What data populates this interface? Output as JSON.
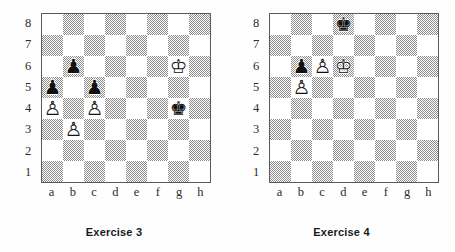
{
  "page": {
    "background_color": "#fefefe",
    "dark_square_color": "#8e8e8e",
    "light_square_color": "#ffffff",
    "border_color": "#5a5a5a"
  },
  "glyphs": {
    "white-king": "♔",
    "white-queen": "♕",
    "white-rook": "♖",
    "white-bishop": "♗",
    "white-knight": "♘",
    "white-pawn": "♙",
    "black-king": "♚",
    "black-queen": "♛",
    "black-rook": "♜",
    "black-bishop": "♝",
    "black-knight": "♞",
    "black-pawn": "♟"
  },
  "rank_labels": [
    "8",
    "7",
    "6",
    "5",
    "4",
    "3",
    "2",
    "1"
  ],
  "file_labels": [
    "a",
    "b",
    "c",
    "d",
    "e",
    "f",
    "g",
    "h"
  ],
  "diagrams": [
    {
      "caption": "Exercise 3",
      "pieces": [
        {
          "square": "b6",
          "piece": "black-pawn",
          "glyph": "♟",
          "color": "black"
        },
        {
          "square": "g6",
          "piece": "white-king",
          "glyph": "♔",
          "color": "white"
        },
        {
          "square": "a5",
          "piece": "black-pawn",
          "glyph": "♟",
          "color": "black"
        },
        {
          "square": "c5",
          "piece": "black-pawn",
          "glyph": "♟",
          "color": "black"
        },
        {
          "square": "a4",
          "piece": "white-pawn",
          "glyph": "♙",
          "color": "white"
        },
        {
          "square": "c4",
          "piece": "white-pawn",
          "glyph": "♙",
          "color": "white"
        },
        {
          "square": "g4",
          "piece": "black-king",
          "glyph": "♚",
          "color": "black"
        },
        {
          "square": "b3",
          "piece": "white-pawn",
          "glyph": "♙",
          "color": "white"
        }
      ]
    },
    {
      "caption": "Exercise 4",
      "pieces": [
        {
          "square": "d8",
          "piece": "black-king",
          "glyph": "♚",
          "color": "black"
        },
        {
          "square": "b6",
          "piece": "black-pawn",
          "glyph": "♟",
          "color": "black"
        },
        {
          "square": "c6",
          "piece": "white-pawn",
          "glyph": "♙",
          "color": "white"
        },
        {
          "square": "d6",
          "piece": "white-king",
          "glyph": "♔",
          "color": "white"
        },
        {
          "square": "b5",
          "piece": "white-pawn",
          "glyph": "♙",
          "color": "white"
        }
      ]
    }
  ]
}
